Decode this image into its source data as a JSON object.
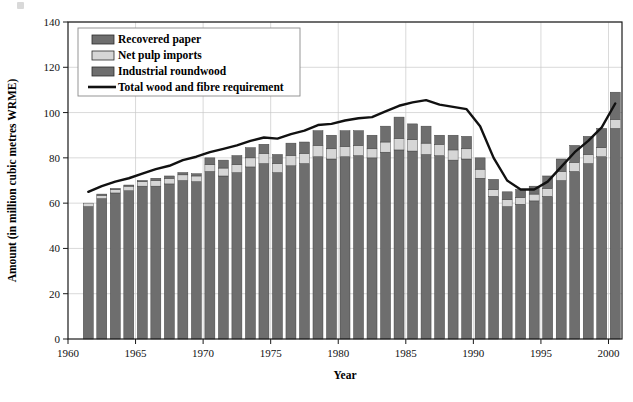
{
  "chart_data": {
    "type": "bar",
    "subtype": "stacked-bar-with-line-overlay",
    "title": "",
    "xlabel": "Year",
    "ylabel": "Amount (in million cubic metres WRME)",
    "xlim": [
      1960,
      2001
    ],
    "ylim": [
      0,
      140
    ],
    "ytick_step": 20,
    "yticks": [
      0,
      20,
      40,
      60,
      80,
      100,
      120,
      140
    ],
    "xticks": [
      1960,
      1965,
      1970,
      1975,
      1980,
      1985,
      1990,
      1995,
      2000
    ],
    "grid": "horizontal-and-vertical-light",
    "legend_position": "upper-left-inside",
    "categories": [
      1961,
      1962,
      1963,
      1964,
      1965,
      1966,
      1967,
      1968,
      1969,
      1970,
      1971,
      1972,
      1973,
      1974,
      1975,
      1976,
      1977,
      1978,
      1979,
      1980,
      1981,
      1982,
      1983,
      1984,
      1985,
      1986,
      1987,
      1988,
      1989,
      1990,
      1991,
      1992,
      1993,
      1994,
      1995,
      1996,
      1997,
      1998,
      1999,
      2000
    ],
    "series": [
      {
        "name": "Industrial roundwood",
        "color": "#6e6e6e",
        "values": [
          58.5,
          62.0,
          64.5,
          65.5,
          67.5,
          67.5,
          68.5,
          70.0,
          69.5,
          74.0,
          72.0,
          73.5,
          76.0,
          77.5,
          73.5,
          76.5,
          77.5,
          80.5,
          79.5,
          80.5,
          81.0,
          80.0,
          82.5,
          83.5,
          83.0,
          81.5,
          81.0,
          79.0,
          79.5,
          71.0,
          63.0,
          58.5,
          59.5,
          61.0,
          63.0,
          70.0,
          74.0,
          77.5,
          80.5,
          93.0
        ]
      },
      {
        "name": "Net pulp imports",
        "color": "#d6d6d6",
        "values": [
          1.5,
          1.5,
          1.5,
          2.0,
          2.0,
          2.5,
          2.5,
          2.5,
          2.5,
          3.0,
          3.5,
          3.5,
          4.0,
          4.5,
          4.0,
          4.5,
          4.5,
          5.0,
          4.5,
          4.5,
          4.5,
          4.0,
          4.5,
          5.0,
          5.0,
          5.0,
          5.0,
          4.5,
          4.5,
          4.0,
          3.0,
          3.0,
          3.0,
          3.0,
          3.5,
          4.0,
          4.0,
          4.0,
          4.0,
          4.0
        ]
      },
      {
        "name": "Recovered paper",
        "color": "#6e6e6e",
        "values": [
          0.0,
          0.5,
          0.5,
          0.5,
          0.5,
          1.0,
          1.0,
          1.0,
          1.0,
          3.0,
          3.5,
          4.0,
          4.5,
          4.0,
          4.0,
          5.5,
          5.0,
          6.5,
          6.0,
          7.0,
          6.5,
          6.0,
          7.0,
          9.5,
          7.0,
          7.5,
          4.0,
          6.5,
          5.5,
          5.0,
          4.5,
          3.5,
          3.5,
          3.5,
          5.5,
          5.5,
          7.5,
          8.0,
          8.5,
          12.0
        ]
      }
    ],
    "line_series": {
      "name": "Total wood and fibre requirement",
      "color": "#111111",
      "x": [
        1961,
        1962,
        1963,
        1964,
        1965,
        1966,
        1967,
        1968,
        1969,
        1970,
        1971,
        1972,
        1973,
        1974,
        1975,
        1976,
        1977,
        1978,
        1979,
        1980,
        1981,
        1982,
        1983,
        1984,
        1985,
        1986,
        1987,
        1988,
        1989,
        1990,
        1991,
        1992,
        1993,
        1994,
        1995,
        1996,
        1997,
        1998,
        1999,
        2000
      ],
      "y": [
        65.0,
        67.5,
        69.5,
        71.0,
        73.0,
        75.0,
        76.5,
        79.0,
        80.5,
        82.5,
        84.0,
        85.5,
        87.5,
        89.0,
        88.5,
        90.5,
        92.0,
        94.5,
        95.0,
        96.5,
        97.5,
        98.0,
        100.5,
        103.0,
        104.5,
        105.5,
        103.5,
        102.5,
        101.5,
        94.0,
        80.0,
        70.0,
        66.0,
        66.0,
        69.5,
        76.0,
        82.5,
        87.5,
        93.5,
        104.0
      ]
    }
  },
  "legend": {
    "entries": [
      {
        "label": "Recovered paper",
        "swatch": "dark-gray-fill",
        "type": "box"
      },
      {
        "label": "Net pulp imports",
        "swatch": "light-gray-fill",
        "type": "box"
      },
      {
        "label": "Industrial roundwood",
        "swatch": "dark-gray-fill",
        "type": "box"
      },
      {
        "label": "Total wood and fibre requirement",
        "swatch": "black-line",
        "type": "line"
      }
    ]
  }
}
